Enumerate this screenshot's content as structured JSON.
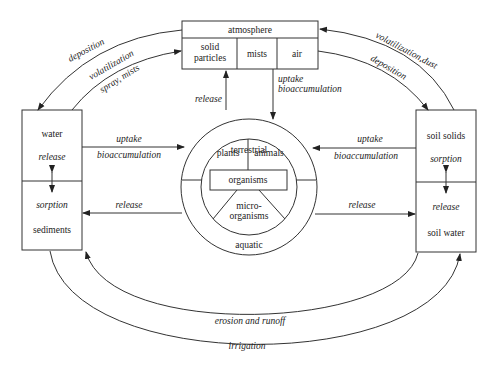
{
  "atmosphere": {
    "title": "atmosphere",
    "compartments": [
      "solid",
      "particles",
      "mists",
      "air"
    ]
  },
  "left_box": {
    "top_label": "water",
    "top_process": "release",
    "bottom_process": "sorption",
    "bottom_label": "sediments"
  },
  "right_box": {
    "top_label": "soil solids",
    "top_process": "sorption",
    "bottom_process": "release",
    "bottom_label": "soil water"
  },
  "organisms": {
    "outer_top": "terrestrial",
    "outer_bottom": "aquatic",
    "plants": "plants",
    "animals": "animals",
    "center": "organisms",
    "micro_1": "micro-",
    "micro_2": "organisms"
  },
  "flows": {
    "left_deposition": "deposition",
    "left_volatilization": "volatilization",
    "left_spray": "spray, mists",
    "right_volatilization": "volatilization,dust",
    "right_deposition": "deposition",
    "atm_release": "release",
    "atm_uptake": "uptake",
    "atm_bioaccumulation": "bioaccumulation",
    "left_uptake": "uptake",
    "left_bioaccumulation": "bioaccumulation",
    "left_release": "release",
    "right_uptake": "uptake",
    "right_bioaccumulation": "bioaccumulation",
    "right_release": "release",
    "erosion": "erosion and runoff",
    "irrigation": "irrigation"
  }
}
